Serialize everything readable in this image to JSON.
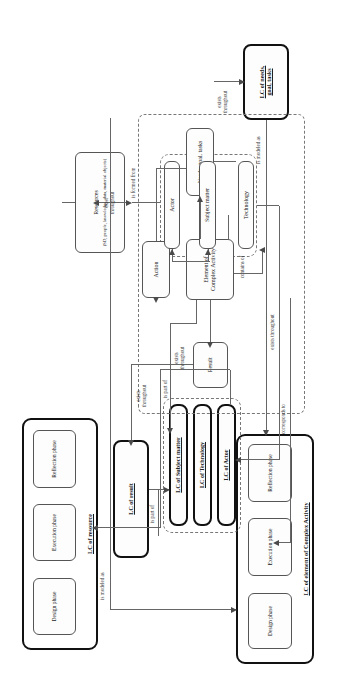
{
  "figure": {
    "caption": ""
  },
  "containers": {
    "lc_element_complex_activity": {
      "title": "LC of element of Complex Activity",
      "phases": [
        "Design phase",
        "Execution phase",
        "Reflection phase"
      ]
    },
    "lc_resource": {
      "title": "LC of resource",
      "phases": [
        "Design phase",
        "Execution phase",
        "Reflection phase"
      ]
    }
  },
  "nodes": {
    "lc_needs_goal_tasks": "LC of needs,\ngoal, tasks",
    "lc_result": "LC of result",
    "lc_subject_matter": "LC of Subject matter",
    "lc_technology": "LC of Technology",
    "lc_actor": "LC of Actor",
    "element_of_complex_activity": "Element of\nComplex Activity",
    "needs_goal_tasks": "Needs, goal, tasks",
    "action": "Action",
    "result": "Result",
    "technology": "Technology",
    "subject_matter": "Subject matter",
    "actor": "Actor",
    "resources_title": "Resources",
    "resources_subtitle": "(SD, people, knowledge, data, material objects)"
  },
  "edge_labels": {
    "is_modeled_as_top": "is modeled as",
    "is_modeled_as_bottom": "is modeled as",
    "is_part_of_result": "is part of",
    "is_part_of_actor": "is part of",
    "exists_throughout_1": "exists\nthroughout",
    "exists_throughout_2": "exists\nthroughout",
    "exists_throughout_3": "exists throughout",
    "exists_throughout_4": "exists\nthroughout",
    "exists_throughout_5": "exist\nthroughout",
    "corresponds_to": "corresponds to",
    "contains_of": "contains of",
    "is_formed_from": "is formed from"
  },
  "colors": {
    "node_border": "#555555",
    "node_border_strong": "#111111",
    "connector": "#666666",
    "background": "#ffffff",
    "text": "#1a1a1a"
  }
}
